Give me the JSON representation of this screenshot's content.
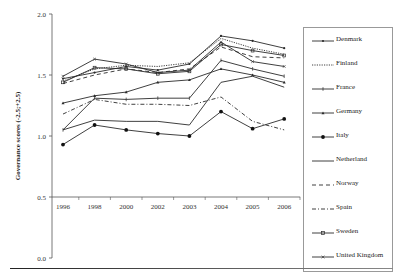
{
  "chart_data": {
    "type": "line",
    "title": "",
    "xlabel": "",
    "ylabel": "Governance scores (-2.5;+2.5)",
    "ylim": [
      0.0,
      2.0
    ],
    "yticks": [
      "0.0",
      "0.5",
      "1.0",
      "1.5",
      "2.0"
    ],
    "x_axis_crosses_at": 0.5,
    "grid": false,
    "legend_position": "right",
    "categories": [
      "1996",
      "1998",
      "2000",
      "2002",
      "2003",
      "2004",
      "2005",
      "2006"
    ],
    "series": [
      {
        "name": "Denmark",
        "style": "solid-marker-dash",
        "values": [
          1.47,
          1.52,
          1.57,
          1.54,
          1.59,
          1.82,
          1.78,
          1.72
        ]
      },
      {
        "name": "Finland",
        "style": "dotted",
        "values": [
          1.45,
          1.55,
          1.58,
          1.57,
          1.6,
          1.8,
          1.72,
          1.67
        ]
      },
      {
        "name": "France",
        "style": "solid-marker-plus",
        "values": [
          1.05,
          1.31,
          1.3,
          1.31,
          1.31,
          1.62,
          1.55,
          1.49
        ]
      },
      {
        "name": "Germany",
        "style": "solid-marker-small",
        "values": [
          1.27,
          1.33,
          1.36,
          1.44,
          1.46,
          1.55,
          1.5,
          1.44
        ]
      },
      {
        "name": "Italy",
        "style": "solid-marker-dot",
        "values": [
          0.93,
          1.09,
          1.05,
          1.02,
          1.0,
          1.2,
          1.06,
          1.14
        ]
      },
      {
        "name": "Netherland",
        "style": "solid",
        "values": [
          1.05,
          1.13,
          1.12,
          1.12,
          1.09,
          1.44,
          1.49,
          1.4
        ]
      },
      {
        "name": "Norway",
        "style": "dashed",
        "values": [
          1.43,
          1.5,
          1.55,
          1.52,
          1.55,
          1.73,
          1.65,
          1.64
        ]
      },
      {
        "name": "Spain",
        "style": "dash-dot",
        "values": [
          1.18,
          1.3,
          1.26,
          1.26,
          1.25,
          1.32,
          1.12,
          1.05
        ]
      },
      {
        "name": "Sweden",
        "style": "solid-marker-square",
        "values": [
          1.44,
          1.56,
          1.55,
          1.51,
          1.53,
          1.75,
          1.7,
          1.66
        ]
      },
      {
        "name": "United Kingdom",
        "style": "solid-marker-x",
        "values": [
          1.49,
          1.63,
          1.59,
          1.52,
          1.54,
          1.77,
          1.61,
          1.57
        ]
      }
    ]
  },
  "legend": {
    "items": [
      "Denmark",
      "Finland",
      "France",
      "Germany",
      "Italy",
      "Netherland",
      "Norway",
      "Spain",
      "Sweden",
      "United Kingdom"
    ]
  },
  "axes": {
    "ylabel": "Governance scores (-2.5;+2.5)",
    "yticks": [
      "0.0",
      "0.5",
      "1.0",
      "1.5",
      "2.0"
    ],
    "xticks": [
      "1996",
      "1998",
      "2000",
      "2002",
      "2003",
      "2004",
      "2005",
      "2006"
    ]
  }
}
